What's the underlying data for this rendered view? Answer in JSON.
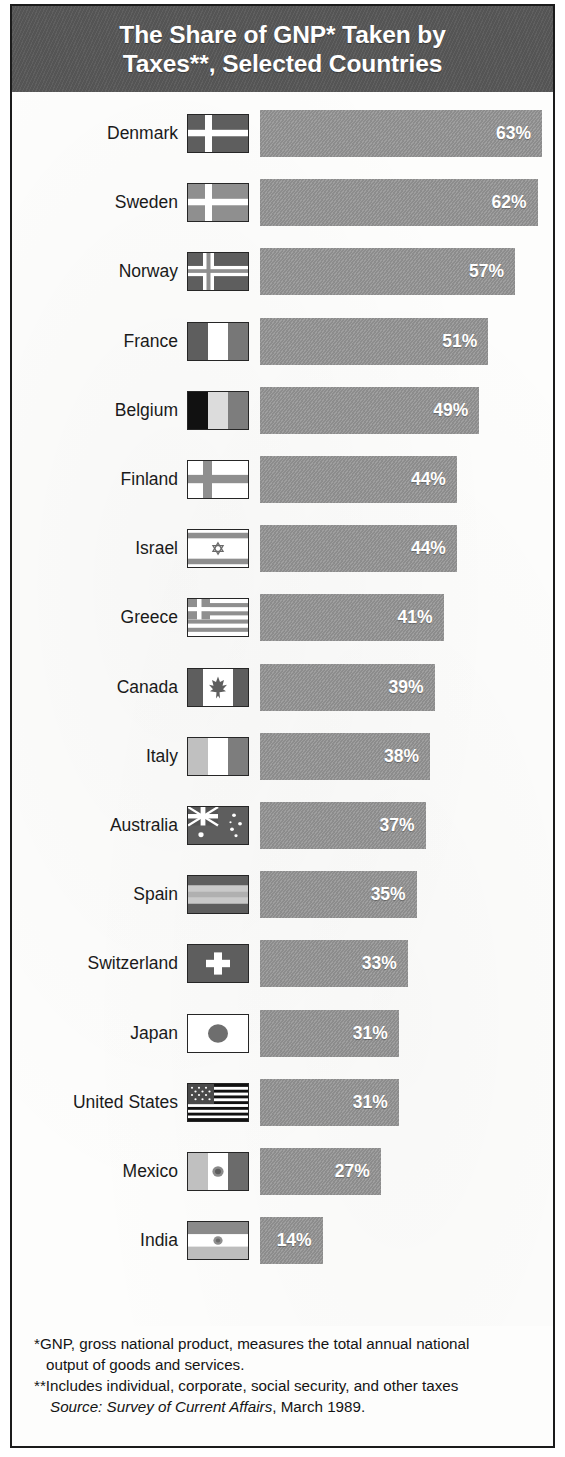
{
  "title": "The Share of GNP* Taken by\nTaxes**, Selected Countries",
  "footnotes": {
    "line1": "*GNP, gross national product, measures the total annual national",
    "line1b": "output of goods and services.",
    "line2": "**Includes individual, corporate, social security, and other taxes",
    "source_italic": "Source: Survey of Current Affairs",
    "source_rest": ", March 1989."
  },
  "colors": {
    "title_band": "#595959",
    "bar_fill": "#949494",
    "bar_label": "#ffffff",
    "border": "#1b1b1b",
    "background": "#fdfdfc"
  },
  "chart_data": {
    "type": "bar",
    "orientation": "horizontal",
    "title": "The Share of GNP* Taken by Taxes**, Selected Countries",
    "xlabel": "",
    "ylabel": "",
    "unit": "percent of GNP",
    "xlim": [
      0,
      63
    ],
    "grid": false,
    "legend": false,
    "categories": [
      "Denmark",
      "Sweden",
      "Norway",
      "France",
      "Belgium",
      "Finland",
      "Israel",
      "Greece",
      "Canada",
      "Italy",
      "Australia",
      "Spain",
      "Switzerland",
      "Japan",
      "United States",
      "Mexico",
      "India"
    ],
    "values": [
      63,
      62,
      57,
      51,
      49,
      44,
      44,
      41,
      39,
      38,
      37,
      35,
      33,
      31,
      31,
      27,
      14
    ],
    "labels": [
      "63%",
      "62%",
      "57%",
      "51%",
      "49%",
      "44%",
      "44%",
      "41%",
      "39%",
      "38%",
      "37%",
      "35%",
      "33%",
      "31%",
      "31%",
      "27%",
      "14%"
    ]
  },
  "rows": [
    {
      "country": "Denmark",
      "value": 63,
      "label": "63%",
      "flag": "flag-denmark"
    },
    {
      "country": "Sweden",
      "value": 62,
      "label": "62%",
      "flag": "flag-sweden"
    },
    {
      "country": "Norway",
      "value": 57,
      "label": "57%",
      "flag": "flag-norway"
    },
    {
      "country": "France",
      "value": 51,
      "label": "51%",
      "flag": "flag-france"
    },
    {
      "country": "Belgium",
      "value": 49,
      "label": "49%",
      "flag": "flag-belgium"
    },
    {
      "country": "Finland",
      "value": 44,
      "label": "44%",
      "flag": "flag-finland"
    },
    {
      "country": "Israel",
      "value": 44,
      "label": "44%",
      "flag": "flag-israel"
    },
    {
      "country": "Greece",
      "value": 41,
      "label": "41%",
      "flag": "flag-greece"
    },
    {
      "country": "Canada",
      "value": 39,
      "label": "39%",
      "flag": "flag-canada"
    },
    {
      "country": "Italy",
      "value": 38,
      "label": "38%",
      "flag": "flag-italy"
    },
    {
      "country": "Australia",
      "value": 37,
      "label": "37%",
      "flag": "flag-australia"
    },
    {
      "country": "Spain",
      "value": 35,
      "label": "35%",
      "flag": "flag-spain"
    },
    {
      "country": "Switzerland",
      "value": 33,
      "label": "33%",
      "flag": "flag-switzerland"
    },
    {
      "country": "Japan",
      "value": 31,
      "label": "31%",
      "flag": "flag-japan"
    },
    {
      "country": "United States",
      "value": 31,
      "label": "31%",
      "flag": "flag-united-states"
    },
    {
      "country": "Mexico",
      "value": 27,
      "label": "27%",
      "flag": "flag-mexico"
    },
    {
      "country": "India",
      "value": 14,
      "label": "14%",
      "flag": "flag-india"
    }
  ]
}
